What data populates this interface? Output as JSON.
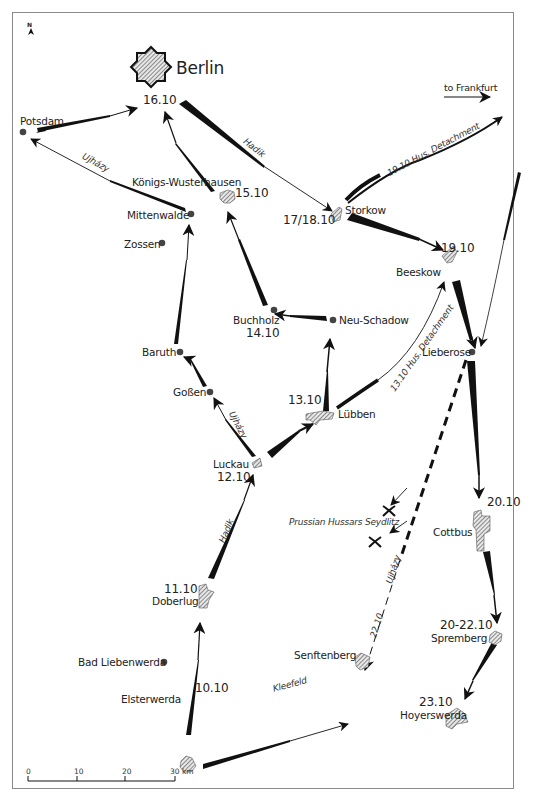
{
  "map": {
    "compass": "N",
    "scale_bar": {
      "ticks": [
        "0",
        "10",
        "20",
        "30 km"
      ]
    },
    "places": [
      {
        "name": "Berlin",
        "date": "16.10",
        "type": "fortress"
      },
      {
        "name": "Potsdam",
        "date": "",
        "type": "dot"
      },
      {
        "name": "Königs-Wusterhausen",
        "date": "15.10",
        "type": "town"
      },
      {
        "name": "Mittenwalde",
        "date": "",
        "type": "dot"
      },
      {
        "name": "Zossen",
        "date": "",
        "type": "dot"
      },
      {
        "name": "Storkow",
        "date": "17/18.10",
        "type": "town"
      },
      {
        "name": "Beeskow",
        "date": "19.10",
        "type": "town"
      },
      {
        "name": "Buchholz",
        "date": "14.10",
        "type": "dot"
      },
      {
        "name": "Neu-Schadow",
        "date": "",
        "type": "dot"
      },
      {
        "name": "Baruth",
        "date": "",
        "type": "dot"
      },
      {
        "name": "Goßen",
        "date": "",
        "type": "dot"
      },
      {
        "name": "Lübben",
        "date": "13.10",
        "type": "town"
      },
      {
        "name": "Lieberose",
        "date": "",
        "type": "dot"
      },
      {
        "name": "Luckau",
        "date": "12.10",
        "type": "town"
      },
      {
        "name": "Cottbus",
        "date": "20.10",
        "type": "town"
      },
      {
        "name": "Doberlug",
        "date": "11.10",
        "type": "town"
      },
      {
        "name": "Spremberg",
        "date": "20-22.10",
        "type": "town"
      },
      {
        "name": "Bad Liebenwerda",
        "date": "",
        "type": "dot"
      },
      {
        "name": "Senftenberg",
        "date": "",
        "type": "town"
      },
      {
        "name": "Elsterwerda",
        "date": "10.10",
        "type": "town"
      },
      {
        "name": "Hoyerswerda",
        "date": "23.10",
        "type": "town"
      }
    ],
    "route_labels": {
      "hadik_north": "Hadik",
      "hadik_south": "Hadik",
      "ujhazy_potsdam": "Ujházy",
      "ujhazy_luckau": "Ujházy",
      "ujhazy_dashed": "Ujházy",
      "dashed_date": "22.10",
      "kleefeld": "Kleefeld",
      "hus_detachment_1910": "19.10  Hus. Detachment",
      "hus_detachment_1310": "13.10  Hus. Detachment",
      "to_frankfurt": "to Frankfurt",
      "prussian_hussars": "Prussian Hussars Seydlitz"
    }
  }
}
